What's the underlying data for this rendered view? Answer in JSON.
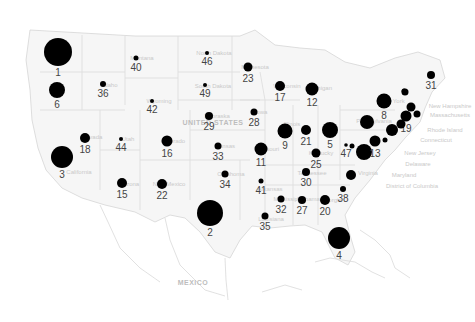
{
  "map": {
    "type": "bubble-map",
    "region": "United States",
    "background": "#ffffff",
    "bubble_color": "#000000",
    "label_color": "#444444",
    "country_labels": [
      {
        "text": "UNITED STATES",
        "x": 213,
        "y": 125
      },
      {
        "text": "MEXICO",
        "x": 193,
        "y": 285
      }
    ],
    "east_coast_labels": [
      {
        "text": "New Hampshire",
        "x": 450,
        "y": 108
      },
      {
        "text": "Massachusetts",
        "x": 450,
        "y": 117
      },
      {
        "text": "Rhode Island",
        "x": 445,
        "y": 132
      },
      {
        "text": "Connecticut",
        "x": 436,
        "y": 142
      },
      {
        "text": "New Jersey",
        "x": 420,
        "y": 155
      },
      {
        "text": "Delaware",
        "x": 418,
        "y": 166
      },
      {
        "text": "Maryland",
        "x": 404,
        "y": 177
      },
      {
        "text": "District of Columbia",
        "x": 412,
        "y": 188
      }
    ],
    "state_labels": [
      {
        "text": "Montana",
        "x": 135,
        "y": 58
      },
      {
        "text": "Idaho",
        "x": 103,
        "y": 85
      },
      {
        "text": "Wyoming",
        "x": 152,
        "y": 101
      },
      {
        "text": "North Dakota",
        "x": 207,
        "y": 53
      },
      {
        "text": "South Dakota",
        "x": 206,
        "y": 86
      },
      {
        "text": "Minnesota",
        "x": 248,
        "y": 67
      },
      {
        "text": "Wisconsin",
        "x": 280,
        "y": 86
      },
      {
        "text": "Michigan",
        "x": 313,
        "y": 88
      },
      {
        "text": "Nebraska",
        "x": 210,
        "y": 116
      },
      {
        "text": "Iowa",
        "x": 254,
        "y": 112
      },
      {
        "text": "Illinois",
        "x": 285,
        "y": 124
      },
      {
        "text": "Nevada",
        "x": 85,
        "y": 137
      },
      {
        "text": "Utah",
        "x": 121,
        "y": 139
      },
      {
        "text": "Colorado",
        "x": 166,
        "y": 141
      },
      {
        "text": "Kansas",
        "x": 218,
        "y": 146
      },
      {
        "text": "Missouri",
        "x": 261,
        "y": 149
      },
      {
        "text": "California",
        "x": 72,
        "y": 172
      },
      {
        "text": "Arizona",
        "x": 122,
        "y": 184
      },
      {
        "text": "New Mexico",
        "x": 162,
        "y": 184
      },
      {
        "text": "Oklahoma",
        "x": 224,
        "y": 174
      },
      {
        "text": "Arkansas",
        "x": 263,
        "y": 189
      },
      {
        "text": "Tennessee",
        "x": 305,
        "y": 173
      },
      {
        "text": "Kentucky",
        "x": 314,
        "y": 153
      },
      {
        "text": "Virginia",
        "x": 361,
        "y": 173
      },
      {
        "text": "Mississippi",
        "x": 281,
        "y": 199
      },
      {
        "text": "Alabama",
        "x": 301,
        "y": 199
      },
      {
        "text": "Georgia",
        "x": 324,
        "y": 200
      },
      {
        "text": "Louisiana",
        "x": 264,
        "y": 219
      },
      {
        "text": "New York",
        "x": 385,
        "y": 101
      },
      {
        "text": "Pennsylvania",
        "x": 367,
        "y": 121
      }
    ]
  },
  "chart_data": {
    "type": "bubble-map",
    "title": "",
    "encoding": "bubble size proportional to value; label = rank",
    "points": [
      {
        "state": "Washington",
        "rank": 1,
        "x": 58,
        "y": 52,
        "r": 14
      },
      {
        "state": "Texas",
        "rank": 2,
        "x": 210,
        "y": 213,
        "r": 13
      },
      {
        "state": "California",
        "rank": 3,
        "x": 62,
        "y": 157,
        "r": 11
      },
      {
        "state": "Florida",
        "rank": 4,
        "x": 339,
        "y": 238,
        "r": 11
      },
      {
        "state": "Ohio",
        "rank": 5,
        "x": 330,
        "y": 130,
        "r": 8
      },
      {
        "state": "Oregon",
        "rank": 6,
        "x": 57,
        "y": 90,
        "r": 8
      },
      {
        "state": "Virginia",
        "rank": 7,
        "x": 364,
        "y": 152,
        "r": 8
      },
      {
        "state": "New York",
        "rank": 8,
        "x": 384,
        "y": 101,
        "r": 7.5
      },
      {
        "state": "Illinois",
        "rank": 9,
        "x": 285,
        "y": 131,
        "r": 7.5
      },
      {
        "state": "Pennsylvania",
        "rank": 10,
        "x": 367,
        "y": 122,
        "r": 7
      },
      {
        "state": "Missouri",
        "rank": 11,
        "x": 261,
        "y": 149,
        "r": 6.5
      },
      {
        "state": "Michigan",
        "rank": 12,
        "x": 312,
        "y": 89,
        "r": 6.5
      },
      {
        "state": "Maryland",
        "rank": 13,
        "x": 375,
        "y": 141,
        "r": 5.5
      },
      {
        "state": "New Jersey",
        "rank": 14,
        "x": 392,
        "y": 130,
        "r": 6
      },
      {
        "state": "Arizona",
        "rank": 15,
        "x": 122,
        "y": 183,
        "r": 5
      },
      {
        "state": "Colorado",
        "rank": 16,
        "x": 167,
        "y": 141,
        "r": 5.5
      },
      {
        "state": "Wisconsin",
        "rank": 17,
        "x": 280,
        "y": 86,
        "r": 5
      },
      {
        "state": "Nevada",
        "rank": 18,
        "x": 85,
        "y": 138,
        "r": 5
      },
      {
        "state": "Massachusetts",
        "rank": 19,
        "x": 406,
        "y": 116,
        "r": 5.5
      },
      {
        "state": "Georgia",
        "rank": 20,
        "x": 325,
        "y": 200,
        "r": 5
      },
      {
        "state": "Indiana",
        "rank": 21,
        "x": 306,
        "y": 130,
        "r": 5
      },
      {
        "state": "New Mexico",
        "rank": 22,
        "x": 162,
        "y": 184,
        "r": 5
      },
      {
        "state": "Minnesota",
        "rank": 23,
        "x": 248,
        "y": 67,
        "r": 4.5
      },
      {
        "state": "Connecticut",
        "rank": 24,
        "x": 401,
        "y": 124,
        "r": 4.5
      },
      {
        "state": "Kentucky",
        "rank": 25,
        "x": 316,
        "y": 153,
        "r": 4.5
      },
      {
        "state": "New Hampshire",
        "rank": 26,
        "x": 411,
        "y": 107,
        "r": 4.5
      },
      {
        "state": "Alabama",
        "rank": 27,
        "x": 302,
        "y": 200,
        "r": 4
      },
      {
        "state": "Iowa",
        "rank": 28,
        "x": 254,
        "y": 112,
        "r": 3.5
      },
      {
        "state": "Nebraska",
        "rank": 29,
        "x": 209,
        "y": 116,
        "r": 4
      },
      {
        "state": "Tennessee",
        "rank": 30,
        "x": 306,
        "y": 172,
        "r": 4
      },
      {
        "state": "Maine",
        "rank": 31,
        "x": 431,
        "y": 75,
        "r": 4
      },
      {
        "state": "Mississippi",
        "rank": 32,
        "x": 281,
        "y": 199,
        "r": 3.5
      },
      {
        "state": "Kansas",
        "rank": 33,
        "x": 218,
        "y": 146,
        "r": 3.5
      },
      {
        "state": "Oklahoma",
        "rank": 34,
        "x": 225,
        "y": 174,
        "r": 3.5
      },
      {
        "state": "Louisiana",
        "rank": 35,
        "x": 265,
        "y": 216,
        "r": 3.5
      },
      {
        "state": "Idaho",
        "rank": 36,
        "x": 103,
        "y": 84,
        "r": 3
      },
      {
        "state": "Vermont",
        "rank": 37,
        "x": 405,
        "y": 92,
        "r": 3.5
      },
      {
        "state": "South Carolina",
        "rank": 38,
        "x": 343,
        "y": 189,
        "r": 3
      },
      {
        "state": "Rhode Island",
        "rank": 39,
        "x": 417,
        "y": 114,
        "r": 3.5
      },
      {
        "state": "Montana",
        "rank": 40,
        "x": 136,
        "y": 58,
        "r": 2.5
      },
      {
        "state": "Arkansas",
        "rank": 41,
        "x": 261,
        "y": 181,
        "r": 2.5
      },
      {
        "state": "Wyoming",
        "rank": 42,
        "x": 152,
        "y": 101,
        "r": 2
      },
      {
        "state": "Delaware",
        "rank": 43,
        "x": 385,
        "y": 140,
        "r": 2.5
      },
      {
        "state": "Utah",
        "rank": 44,
        "x": 121,
        "y": 139,
        "r": 2
      },
      {
        "state": "West Virginia",
        "rank": 45,
        "x": 352,
        "y": 146,
        "r": 2.5
      },
      {
        "state": "North Dakota",
        "rank": 46,
        "x": 207,
        "y": 53,
        "r": 2
      },
      {
        "state": "District of Columbia",
        "rank": 47,
        "x": 346,
        "y": 145,
        "r": 1.8
      },
      {
        "state": "Vermont (north)",
        "rank": 48,
        "x": 404,
        "y": 91,
        "r": 2.5
      },
      {
        "state": "South Dakota",
        "rank": 49,
        "x": 205,
        "y": 85,
        "r": 2
      },
      {
        "state": "North Carolina",
        "rank": 50,
        "x": 351,
        "y": 175,
        "r": 5
      }
    ],
    "visible_rank_labels": [
      1,
      2,
      3,
      4,
      5,
      6,
      8,
      9,
      11,
      12,
      13,
      15,
      16,
      17,
      18,
      19,
      20,
      21,
      22,
      23,
      25,
      27,
      28,
      29,
      30,
      31,
      32,
      33,
      34,
      35,
      36,
      38,
      40,
      41,
      42,
      44,
      46,
      47,
      49
    ]
  }
}
